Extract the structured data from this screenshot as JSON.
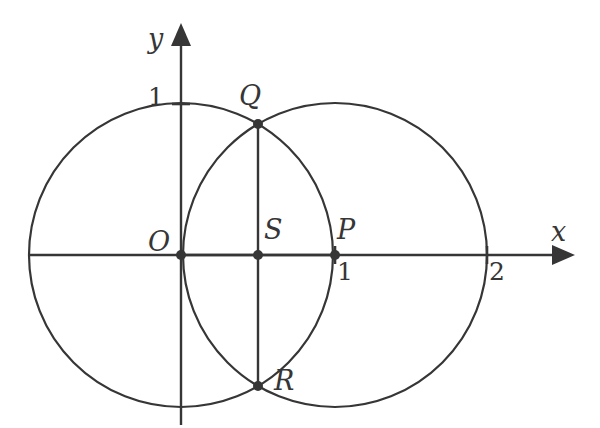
{
  "figure": {
    "background_color": "#ffffff",
    "stroke_color": "#363636",
    "stroke_width": 2.2,
    "width": 600,
    "height": 428
  },
  "axes": {
    "x": {
      "label": "x",
      "arrow": true,
      "ticks": [
        {
          "label": "1",
          "value": 1
        },
        {
          "label": "2",
          "value": 2
        }
      ]
    },
    "y": {
      "label": "y",
      "arrow": true,
      "ticks": [
        {
          "label": "1",
          "value": 1
        }
      ]
    }
  },
  "points": [
    {
      "name": "O",
      "label": "O",
      "x": 0,
      "y": 0,
      "dot": true
    },
    {
      "name": "S",
      "label": "S",
      "x": 0.5,
      "y": 0,
      "dot": true
    },
    {
      "name": "P",
      "label": "P",
      "x": 1,
      "y": 0,
      "dot": true
    },
    {
      "name": "Q",
      "label": "Q",
      "x": 0.5,
      "y": 0.866,
      "dot": true
    },
    {
      "name": "R",
      "label": "R",
      "x": 0.5,
      "y": -0.866,
      "dot": true
    }
  ],
  "circles": [
    {
      "name": "circle-O",
      "center": "O",
      "cx": 0,
      "cy": 0,
      "r": 1
    },
    {
      "name": "circle-P",
      "center": "P",
      "cx": 1,
      "cy": 0,
      "r": 1
    }
  ],
  "segments": [
    {
      "name": "segment-QR",
      "from": "Q",
      "to": "R"
    },
    {
      "name": "segment-OP",
      "from": "O",
      "to": "P"
    }
  ]
}
